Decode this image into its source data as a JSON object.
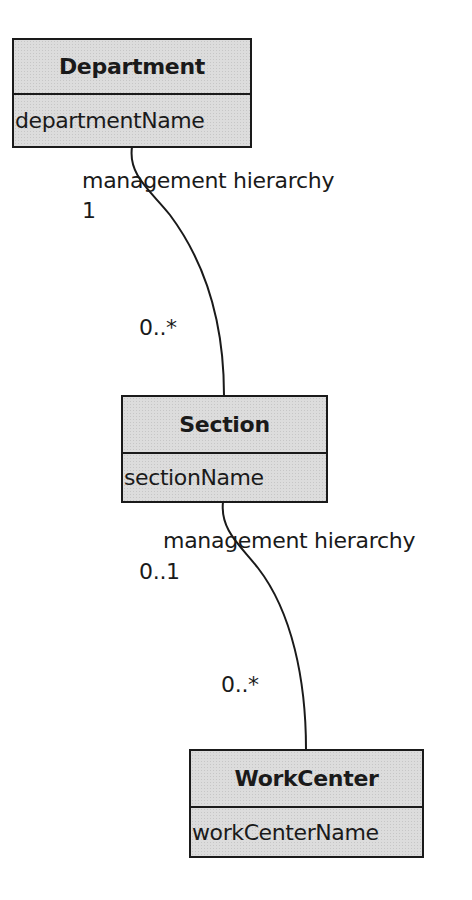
{
  "diagram": {
    "type": "UML class diagram",
    "classes": [
      {
        "name": "Department",
        "attributes": [
          "departmentName"
        ]
      },
      {
        "name": "Section",
        "attributes": [
          "sectionName"
        ]
      },
      {
        "name": "WorkCenter",
        "attributes": [
          "workCenterName"
        ]
      }
    ],
    "associations": [
      {
        "name": "management hierarchy",
        "from": "Department",
        "to": "Section",
        "from_multiplicity": "1",
        "to_multiplicity": "0..*"
      },
      {
        "name": "management hierarchy",
        "from": "Section",
        "to": "WorkCenter",
        "from_multiplicity": "0..1",
        "to_multiplicity": "0..*"
      }
    ]
  },
  "colors": {
    "line": "#1a1a1a",
    "box_fill": "#dcdcdc",
    "background": "#ffffff"
  }
}
